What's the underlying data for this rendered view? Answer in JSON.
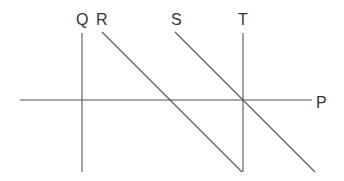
{
  "diagram": {
    "type": "line-geometry",
    "line_color": "#555555",
    "label_color": "#333333",
    "background": "#ffffff",
    "lines": [
      {
        "id": "P",
        "label": "P",
        "orientation": "horizontal",
        "x1": 20,
        "y1": 100,
        "x2": 312,
        "y2": 100,
        "label_x": 316,
        "label_y": 108
      },
      {
        "id": "Q",
        "label": "Q",
        "orientation": "vertical",
        "x1": 82,
        "y1": 33,
        "x2": 82,
        "y2": 172,
        "label_x": 76,
        "label_y": 25
      },
      {
        "id": "R",
        "label": "R",
        "orientation": "diagonal",
        "x1": 102,
        "y1": 32,
        "x2": 242,
        "y2": 172,
        "label_x": 96,
        "label_y": 25
      },
      {
        "id": "S",
        "label": "S",
        "orientation": "diagonal",
        "x1": 175,
        "y1": 32,
        "x2": 315,
        "y2": 172,
        "label_x": 171,
        "label_y": 25
      },
      {
        "id": "T",
        "label": "T",
        "orientation": "vertical",
        "x1": 243,
        "y1": 33,
        "x2": 243,
        "y2": 172,
        "label_x": 238,
        "label_y": 25
      }
    ]
  }
}
